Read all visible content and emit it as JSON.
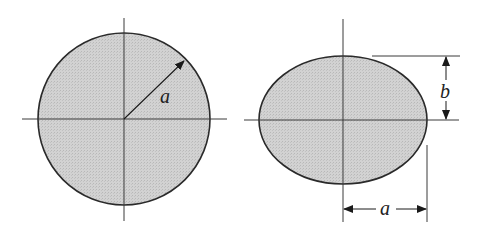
{
  "figure": {
    "colors": {
      "fill": "#cfcfcf",
      "stroke": "#2a2a2a",
      "axis": "#3a3a3a",
      "background": "#ffffff"
    }
  },
  "circle": {
    "shape": "circle",
    "radius_label": "a"
  },
  "ellipse": {
    "shape": "ellipse",
    "vertical_semi_axis_label": "b",
    "horizontal_semi_axis_label": "a"
  }
}
